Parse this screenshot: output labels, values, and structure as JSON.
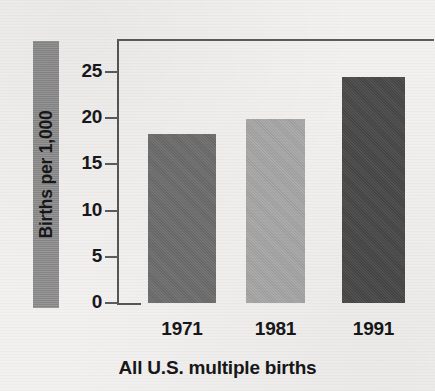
{
  "chart_data": {
    "type": "bar",
    "title": "",
    "subtitle": "",
    "caption": "All U.S. multiple births",
    "xlabel": "",
    "ylabel": "Births per 1,000",
    "categories": [
      "1971",
      "1981",
      "1991"
    ],
    "values": [
      18.3,
      19.9,
      24.5
    ],
    "ylim": [
      0,
      25
    ],
    "yticks": [
      "0",
      "5",
      "10",
      "15",
      "20",
      "25"
    ],
    "ytick_values": [
      0,
      5,
      10,
      15,
      20,
      25
    ],
    "grid": false,
    "legend": "none",
    "bar_colors": [
      "#6e6e6e",
      "#a9a9a9",
      "#494949"
    ],
    "series": [
      {
        "name": "All U.S. multiple births",
        "values": [
          18.3,
          19.9,
          24.5
        ]
      }
    ],
    "points": [
      {
        "category": "1971",
        "value": 18.3,
        "color": "#6e6e6e"
      },
      {
        "category": "1981",
        "value": 19.9,
        "color": "#a9a9a9"
      },
      {
        "category": "1991",
        "value": 24.5,
        "color": "#494949"
      }
    ],
    "axis_color": "#55565a",
    "background_color": "#f3f1ef",
    "ylabel_block_color": "#8d8d8d"
  }
}
